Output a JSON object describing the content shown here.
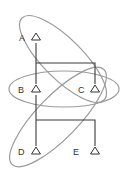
{
  "diagram": {
    "type": "tree-with-overlapping-groups",
    "nodes": [
      {
        "id": "A",
        "label": "A",
        "shape": "triangle"
      },
      {
        "id": "B",
        "label": "B",
        "shape": "triangle"
      },
      {
        "id": "C",
        "label": "C",
        "shape": "triangle"
      },
      {
        "id": "D",
        "label": "D",
        "shape": "triangle"
      },
      {
        "id": "E",
        "label": "E",
        "shape": "triangle"
      }
    ],
    "edges": [
      {
        "from": "A",
        "to": "B"
      },
      {
        "from": "A",
        "to": "C"
      },
      {
        "from": "B",
        "to": "D"
      },
      {
        "from": "B",
        "to": "E"
      }
    ],
    "groups": [
      {
        "id": "group-AC",
        "members": [
          "A",
          "C"
        ]
      },
      {
        "id": "group-BC",
        "members": [
          "B",
          "C"
        ]
      },
      {
        "id": "group-DC",
        "members": [
          "D",
          "C"
        ]
      }
    ],
    "colors": {
      "group_outline": "#9a9a9a",
      "edge": "#3a3a3a",
      "node": "#333333"
    }
  }
}
